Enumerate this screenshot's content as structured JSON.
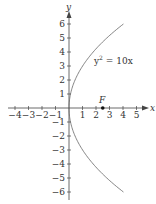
{
  "chart_data": {
    "type": "line",
    "title": "",
    "equation": "y^2 = 10x",
    "equation_label": {
      "base": "y",
      "exp": "2",
      "rest": " = 10x"
    },
    "xlabel": "x",
    "ylabel": "y",
    "xlim": [
      -4.5,
      5.8
    ],
    "ylim": [
      -6.3,
      6.8
    ],
    "x_ticks": [
      -4,
      -3,
      -2,
      -1,
      1,
      2,
      3,
      4,
      5
    ],
    "y_ticks": [
      -6,
      -5,
      -4,
      -3,
      -2,
      -1,
      1,
      2,
      3,
      4,
      5,
      6
    ],
    "x_tick_labels": [
      "−4",
      "−3",
      "−2",
      "−1",
      "1",
      "2",
      "3",
      "4",
      "5"
    ],
    "y_tick_labels": [
      "−6",
      "−5",
      "−4",
      "−3",
      "−2",
      "−1",
      "1",
      "2",
      "3",
      "4",
      "5",
      "6"
    ],
    "grid": false,
    "series": [
      {
        "name": "y^2 = 10x",
        "curve": "parabola opening right",
        "vertex": [
          0,
          0
        ],
        "y_range": [
          -6,
          6
        ]
      }
    ],
    "points": [
      {
        "label": "F",
        "x": 2.5,
        "y": 0
      }
    ]
  }
}
